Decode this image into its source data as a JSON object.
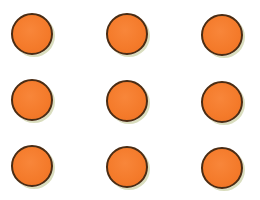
{
  "illustration": {
    "subject": "orange dots",
    "count": 9,
    "rows": 3,
    "columns": 3,
    "colors": {
      "fill": "#F47A2A",
      "outline": "#4A2C14",
      "background": "#FFFFFF"
    },
    "dots": [
      {
        "row": 1,
        "col": 1,
        "x": 32,
        "y": 34
      },
      {
        "row": 1,
        "col": 2,
        "x": 127,
        "y": 34
      },
      {
        "row": 1,
        "col": 3,
        "x": 222,
        "y": 35
      },
      {
        "row": 2,
        "col": 1,
        "x": 32,
        "y": 100
      },
      {
        "row": 2,
        "col": 2,
        "x": 127,
        "y": 101
      },
      {
        "row": 2,
        "col": 3,
        "x": 222,
        "y": 102
      },
      {
        "row": 3,
        "col": 1,
        "x": 32,
        "y": 166
      },
      {
        "row": 3,
        "col": 2,
        "x": 127,
        "y": 167
      },
      {
        "row": 3,
        "col": 3,
        "x": 222,
        "y": 168
      }
    ]
  }
}
